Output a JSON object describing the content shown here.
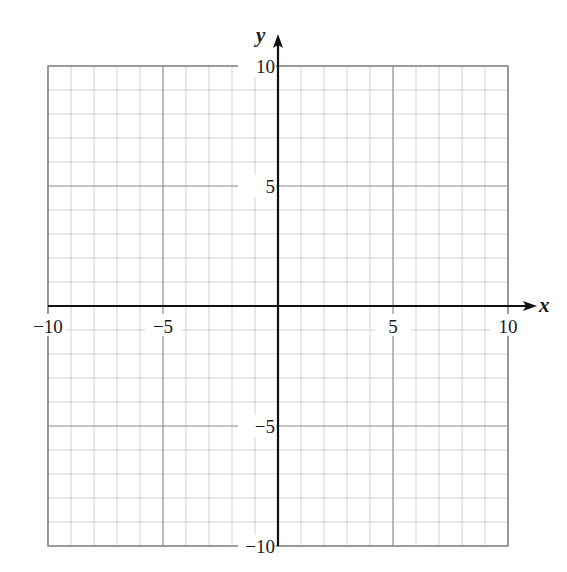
{
  "chart_data": {
    "type": "scatter",
    "title": "",
    "xlabel": "x",
    "ylabel": "y",
    "xlim": [
      -10,
      10
    ],
    "ylim": [
      -10,
      10
    ],
    "grid": true,
    "minor_step": 1,
    "major_step": 5,
    "x_ticks": [
      -10,
      -5,
      5,
      10
    ],
    "y_ticks": [
      -10,
      -5,
      5,
      10
    ],
    "x_tick_labels": [
      "−10",
      "−5",
      "5",
      "10"
    ],
    "y_tick_labels": [
      "−10",
      "−5",
      "5",
      "10"
    ],
    "series": [],
    "legend": null
  },
  "axes": {
    "x_name": "x",
    "y_name": "y"
  },
  "colors": {
    "minor_grid": "#c8c8c8",
    "major_grid": "#8a8a8a",
    "border": "#8a8a8a",
    "axis": "#111111",
    "text": "#1a1a1a"
  }
}
